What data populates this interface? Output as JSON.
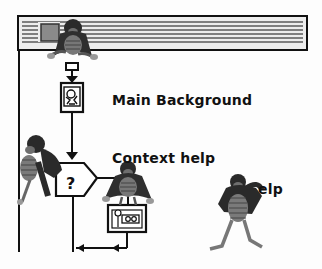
{
  "window": {
    "title_bar": "striped",
    "close_box": true
  },
  "flowchart": {
    "nodes": [
      {
        "id": "start",
        "type": "connector"
      },
      {
        "id": "main-background",
        "type": "display-icon",
        "label": "Main Background"
      },
      {
        "id": "decision",
        "type": "decision",
        "symbol": "?",
        "label": "Context help"
      },
      {
        "id": "help-map",
        "type": "map-icon"
      }
    ]
  },
  "labels": {
    "main_background": "Main Background",
    "context_help": "Context help",
    "decision_symbol": "?",
    "help_partial": "elp"
  },
  "characters": [
    {
      "name": "bug-sitting-titlebar"
    },
    {
      "name": "bug-climbing-left"
    },
    {
      "name": "bug-sitting-decision"
    },
    {
      "name": "bug-standing-help"
    }
  ],
  "colors": {
    "ink": "#111111",
    "background": "#fdfdfd",
    "titlebar_stripe": "#5a5a5a",
    "bug_shell": "#6e6e6e",
    "bug_dark": "#2a2a2a"
  }
}
